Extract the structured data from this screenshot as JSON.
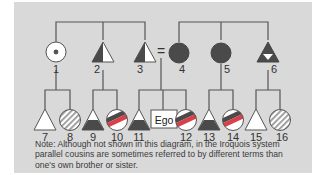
{
  "diagram": {
    "colors": {
      "background": "#d9d9d9",
      "line": "#555555",
      "dark_fill": "#4a4a4a",
      "light_fill": "#ffffff",
      "red_band": "#d8404a"
    },
    "parent_generation": [
      {
        "id": "1",
        "label": "1",
        "shape": "circle",
        "symbol": "circle-with-center-dot"
      },
      {
        "id": "2",
        "label": "2",
        "shape": "triangle",
        "symbol": "triangle-left-half-dark"
      },
      {
        "id": "3",
        "label": "3",
        "shape": "triangle",
        "symbol": "triangle-left-half-dark"
      },
      {
        "id": "equals",
        "label": "=",
        "shape": "marriage",
        "symbol": "equals-sign"
      },
      {
        "id": "4",
        "label": "4",
        "shape": "circle",
        "symbol": "circle-dark"
      },
      {
        "id": "5",
        "label": "5",
        "shape": "circle",
        "symbol": "circle-dark"
      },
      {
        "id": "6",
        "label": "6",
        "shape": "triangle",
        "symbol": "triangle-dark-with-white-inverted-triangle"
      }
    ],
    "child_generation": [
      {
        "id": "7",
        "label": "7",
        "shape": "triangle",
        "symbol": "triangle-white"
      },
      {
        "id": "8",
        "label": "8",
        "shape": "circle",
        "symbol": "circle-hatched"
      },
      {
        "id": "9",
        "label": "9",
        "shape": "triangle",
        "symbol": "triangle-dark-bottom"
      },
      {
        "id": "10",
        "label": "10",
        "shape": "circle",
        "symbol": "circle-red-band"
      },
      {
        "id": "11",
        "label": "11",
        "shape": "triangle",
        "symbol": "triangle-dark-bottom"
      },
      {
        "id": "ego",
        "label": "Ego",
        "shape": "box",
        "symbol": "ego-box"
      },
      {
        "id": "12",
        "label": "12",
        "shape": "circle",
        "symbol": "circle-red-band"
      },
      {
        "id": "13",
        "label": "13",
        "shape": "triangle",
        "symbol": "triangle-dark-bottom"
      },
      {
        "id": "14",
        "label": "14",
        "shape": "circle",
        "symbol": "circle-red-band"
      },
      {
        "id": "15",
        "label": "15",
        "shape": "triangle",
        "symbol": "triangle-white"
      },
      {
        "id": "16",
        "label": "16",
        "shape": "circle",
        "symbol": "circle-hatched"
      }
    ],
    "note": "Note: Although not shown in this diagram, in the Iroquois system parallel cousins are sometimes referred to by different terms than one's own brother or sister."
  }
}
